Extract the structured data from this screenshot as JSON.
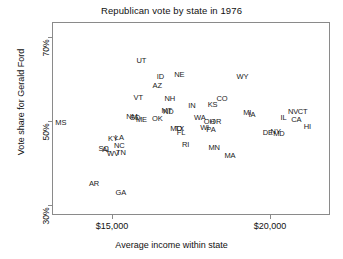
{
  "chart_data": {
    "type": "scatter",
    "title": "Republican vote by state in 1976",
    "xlabel": "Average income within state",
    "ylabel": "Vote share for Gerald Ford",
    "xlim": [
      13100,
      21900
    ],
    "ylim": [
      27.5,
      73.5
    ],
    "xticks": [
      15000,
      20000
    ],
    "xtick_labels": [
      "$15,000",
      "$20,000"
    ],
    "yticks": [
      30,
      50,
      70
    ],
    "ytick_labels": [
      "30%",
      "50%",
      "70%"
    ],
    "grid": false,
    "legend": null,
    "point_style": "text-label",
    "points": [
      {
        "label": "MS",
        "x": 13350,
        "y": 49.6
      },
      {
        "label": "AR",
        "x": 14400,
        "y": 35.1
      },
      {
        "label": "GA",
        "x": 15250,
        "y": 33.0
      },
      {
        "label": "SC",
        "x": 14700,
        "y": 43.4
      },
      {
        "label": "AL",
        "x": 14800,
        "y": 43.3
      },
      {
        "label": "WV",
        "x": 15000,
        "y": 42.2
      },
      {
        "label": "TN",
        "x": 15250,
        "y": 42.5
      },
      {
        "label": "NC",
        "x": 15200,
        "y": 44.2
      },
      {
        "label": "KY",
        "x": 15000,
        "y": 45.9
      },
      {
        "label": "LA",
        "x": 15200,
        "y": 46.2
      },
      {
        "label": "NM",
        "x": 15600,
        "y": 51.0
      },
      {
        "label": "SD",
        "x": 15700,
        "y": 50.8
      },
      {
        "label": "ME",
        "x": 15900,
        "y": 50.3
      },
      {
        "label": "VT",
        "x": 15800,
        "y": 55.6
      },
      {
        "label": "UT",
        "x": 15900,
        "y": 64.5
      },
      {
        "label": "OK",
        "x": 16400,
        "y": 50.6
      },
      {
        "label": "AZ",
        "x": 16400,
        "y": 58.6
      },
      {
        "label": "ID",
        "x": 16500,
        "y": 60.6
      },
      {
        "label": "MT",
        "x": 16700,
        "y": 52.6
      },
      {
        "label": "ND",
        "x": 16750,
        "y": 52.2
      },
      {
        "label": "NH",
        "x": 16800,
        "y": 55.4
      },
      {
        "label": "MO",
        "x": 17000,
        "y": 48.3
      },
      {
        "label": "TX",
        "x": 17100,
        "y": 48.2
      },
      {
        "label": "FL",
        "x": 17150,
        "y": 47.4
      },
      {
        "label": "RI",
        "x": 17300,
        "y": 44.4
      },
      {
        "label": "NE",
        "x": 17100,
        "y": 61.0
      },
      {
        "label": "IN",
        "x": 17500,
        "y": 53.8
      },
      {
        "label": "WA",
        "x": 17750,
        "y": 50.8
      },
      {
        "label": "WI",
        "x": 17900,
        "y": 48.5
      },
      {
        "label": "OH",
        "x": 18050,
        "y": 50.0
      },
      {
        "label": "OR",
        "x": 18250,
        "y": 50.0
      },
      {
        "label": "PA",
        "x": 18100,
        "y": 47.9
      },
      {
        "label": "KS",
        "x": 18150,
        "y": 53.9
      },
      {
        "label": "MN",
        "x": 18200,
        "y": 43.6
      },
      {
        "label": "CO",
        "x": 18450,
        "y": 55.5
      },
      {
        "label": "MA",
        "x": 18700,
        "y": 41.9
      },
      {
        "label": "MI",
        "x": 19250,
        "y": 52.0
      },
      {
        "label": "IA",
        "x": 19400,
        "y": 51.6
      },
      {
        "label": "DE",
        "x": 19900,
        "y": 47.3
      },
      {
        "label": "NY",
        "x": 20150,
        "y": 47.5
      },
      {
        "label": "MD",
        "x": 20250,
        "y": 47.0
      },
      {
        "label": "IL",
        "x": 20400,
        "y": 50.8
      },
      {
        "label": "NV",
        "x": 20700,
        "y": 52.3
      },
      {
        "label": "CA",
        "x": 20800,
        "y": 50.4
      },
      {
        "label": "CT",
        "x": 21000,
        "y": 52.4
      },
      {
        "label": "WY",
        "x": 19100,
        "y": 60.7
      },
      {
        "label": "HI",
        "x": 21150,
        "y": 48.6
      }
    ]
  }
}
